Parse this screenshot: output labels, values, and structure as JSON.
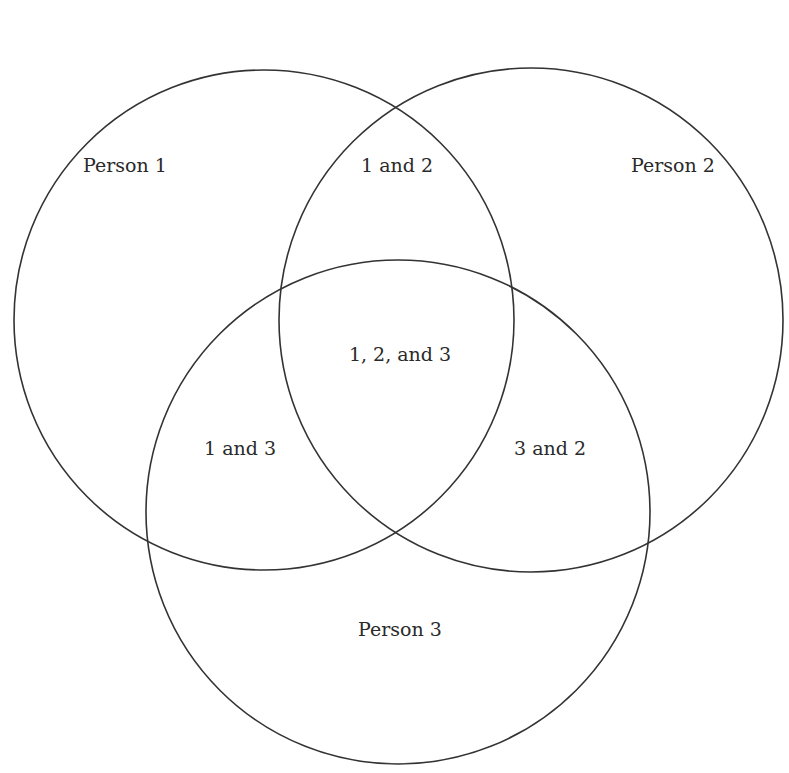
{
  "diagram": {
    "type": "venn",
    "sets": [
      {
        "id": "set-1",
        "label": "Person 1",
        "cx": 264,
        "cy": 320,
        "r": 250,
        "label_x": 125,
        "label_y": 167
      },
      {
        "id": "set-2",
        "label": "Person 2",
        "cx": 531,
        "cy": 320,
        "r": 252,
        "label_x": 673,
        "label_y": 167
      },
      {
        "id": "set-3",
        "label": "Person 3",
        "cx": 398,
        "cy": 512,
        "r": 252,
        "label_x": 400,
        "label_y": 631
      }
    ],
    "intersections": [
      {
        "id": "int-1-2",
        "label": "1 and 2",
        "label_x": 397,
        "label_y": 167
      },
      {
        "id": "int-1-3",
        "label": "1 and 3",
        "label_x": 240,
        "label_y": 450
      },
      {
        "id": "int-3-2",
        "label": "3 and 2",
        "label_x": 550,
        "label_y": 450
      },
      {
        "id": "int-1-2-3",
        "label": "1, 2, and 3",
        "label_x": 400,
        "label_y": 356
      }
    ],
    "stroke_color": "#333333",
    "text_color": "#2a2a2a",
    "background": "#ffffff"
  }
}
